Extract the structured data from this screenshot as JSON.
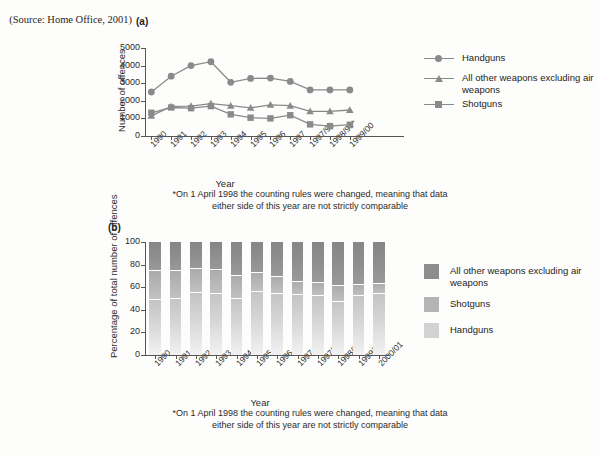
{
  "source_note": "(Source: Home Office, 2001)",
  "panel_a": {
    "label": "(a)",
    "footnote": "*On 1 April 1998 the counting rules were changed, meaning that data either side of this year are not strictly comparable",
    "legend": [
      {
        "label": "Handguns",
        "marker": "circle",
        "color": "#8a8a8a"
      },
      {
        "label": "All other weapons excluding air weapons",
        "marker": "triangle",
        "color": "#8a8a8a"
      },
      {
        "label": "Shotguns",
        "marker": "square",
        "color": "#8a8a8a"
      }
    ]
  },
  "panel_b": {
    "label": "(b)",
    "footnote": "*On 1 April 1998 the counting rules were changed, meaning that data either side of this year are not strictly comparable",
    "legend": [
      {
        "label": "All other weapons excluding air weapons",
        "color": "#8d8d8d"
      },
      {
        "label": "Shotguns",
        "color": "#b4b4b4"
      },
      {
        "label": "Handguns",
        "color": "#d2d2d2"
      }
    ]
  },
  "chart_data": [
    {
      "type": "line",
      "title": "(a)",
      "xlabel": "Year",
      "ylabel": "Number of offences",
      "ylim": [
        0,
        5000
      ],
      "yticks": [
        0,
        1000,
        2000,
        3000,
        4000,
        5000
      ],
      "grid": false,
      "legend_position": "right",
      "categories": [
        "1990",
        "1991",
        "1992",
        "1993",
        "1994",
        "1995",
        "1996",
        "1997",
        "1997/98",
        "1998/99*",
        "1999/00",
        "2000/01"
      ],
      "x": [
        "1990",
        "1991",
        "1992",
        "1993",
        "1994",
        "1995",
        "1996",
        "1997",
        "1997/98",
        "1998/99*",
        "1999/00",
        "2000/01"
      ],
      "series": [
        {
          "name": "Handguns",
          "marker": "circle",
          "values": [
            2500,
            3400,
            4000,
            4220,
            3050,
            3270,
            3290,
            3100,
            2620,
            2620,
            2620,
            3600,
            4080
          ]
        },
        {
          "name": "All other weapons excluding air weapons",
          "marker": "triangle",
          "values": [
            1150,
            1680,
            1700,
            1840,
            1720,
            1600,
            1770,
            1720,
            1400,
            1400,
            1480,
            2080,
            2600
          ]
        },
        {
          "name": "Shotguns",
          "marker": "square",
          "values": [
            1320,
            1620,
            1580,
            1700,
            1230,
            1040,
            1000,
            1180,
            660,
            560,
            640,
            700,
            640
          ]
        }
      ],
      "note": "11 plotted category positions; values read off axis gridlines"
    },
    {
      "type": "bar",
      "subtype": "stacked-100",
      "title": "(b)",
      "xlabel": "Year",
      "ylabel": "Percentage of total number of offences",
      "ylim": [
        0,
        100
      ],
      "yticks": [
        0,
        20,
        40,
        60,
        80,
        100
      ],
      "grid": false,
      "legend_position": "right",
      "categories": [
        "1990",
        "1991",
        "1992",
        "1993",
        "1994",
        "1995",
        "1996",
        "1997",
        "1997/98",
        "1998/99*",
        "1999/00",
        "2000/01"
      ],
      "series": [
        {
          "name": "Handguns",
          "values": [
            49,
            50,
            55,
            54,
            50,
            56,
            54,
            53,
            52,
            47,
            52,
            54
          ]
        },
        {
          "name": "Shotguns",
          "values": [
            25,
            24,
            21,
            21,
            20,
            17,
            15,
            12,
            12,
            14,
            10,
            9
          ]
        },
        {
          "name": "All other weapons excluding air weapons",
          "values": [
            26,
            26,
            24,
            25,
            30,
            27,
            31,
            35,
            36,
            39,
            38,
            37
          ]
        }
      ]
    }
  ]
}
